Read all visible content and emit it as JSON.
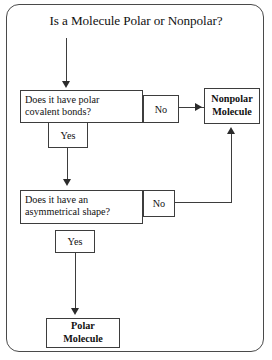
{
  "diagram": {
    "title": "Is a Molecule Polar or Nonpolar?",
    "decision_1": {
      "line_1": "Does it have polar",
      "line_2": "covalent bonds?",
      "no_label": "No",
      "yes_label": "Yes"
    },
    "decision_2": {
      "line_1": "Does it have an",
      "line_2": "asymmetrical shape?",
      "no_label": "No",
      "yes_label": "Yes"
    },
    "terminal_nonpolar": {
      "line_1": "Nonpolar",
      "line_2": "Molecule"
    },
    "terminal_polar": {
      "line_1": "Polar",
      "line_2": "Molecule"
    },
    "colors": {
      "frame": "#4a4a4a",
      "box_border": "#3d3d3d",
      "text": "#111111",
      "arrow": "#2b2b2b",
      "background": "#ffffff"
    }
  }
}
